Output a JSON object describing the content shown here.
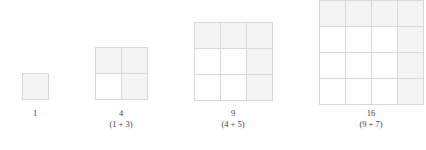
{
  "figure": {
    "title": "",
    "background_color": "#ffffff",
    "cell_border_color": "#d8d8d8",
    "cell_shaded_color": "#f4f4f4",
    "cell_plain_color": "#ffffff",
    "cell_size_px": 26,
    "steps": [
      {
        "id": "step-1",
        "n": 1,
        "total_label": "1",
        "sum_label": "",
        "grid_size": 1,
        "left": 22,
        "top": 73,
        "shaded_cells": [
          0
        ],
        "cells_count": 1
      },
      {
        "id": "step-2",
        "n": 2,
        "total_label": "4",
        "sum_label": "(1 + 3)",
        "grid_size": 2,
        "left": 95,
        "top": 47,
        "shaded_cells": [
          0,
          1,
          3
        ],
        "cells_count": 4
      },
      {
        "id": "step-3",
        "n": 3,
        "total_label": "9",
        "sum_label": "(4 + 5)",
        "grid_size": 3,
        "left": 194,
        "top": 22,
        "shaded_cells": [
          0,
          1,
          2,
          5,
          8
        ],
        "cells_count": 9
      },
      {
        "id": "step-4",
        "n": 4,
        "total_label": "16",
        "sum_label": "(9 + 7)",
        "grid_size": 4,
        "left": 319,
        "top": 0,
        "shaded_cells": [
          0,
          1,
          2,
          3,
          7,
          11,
          15
        ],
        "cells_count": 16
      }
    ],
    "captions": [
      {
        "total": "1",
        "sum": "",
        "center_x": 35,
        "top": 108
      },
      {
        "total": "4",
        "sum": "(1 + 3)",
        "center_x": 121,
        "top": 108
      },
      {
        "total": "9",
        "sum": "(4 + 5)",
        "center_x": 233,
        "top": 108
      },
      {
        "total": "16",
        "sum": "(9 + 7)",
        "center_x": 371,
        "top": 108
      }
    ]
  }
}
